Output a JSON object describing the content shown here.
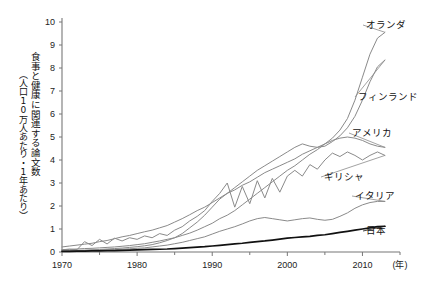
{
  "chart_data": {
    "type": "line",
    "title": "",
    "xlabel": "(年)",
    "ylabel_main": "食事と健康に関連する論文数",
    "ylabel_sub": "（人口10万人あたり・1年あたり）",
    "xlim": [
      1970,
      2015
    ],
    "ylim": [
      0,
      10
    ],
    "ytick_labels": [
      "0",
      "1",
      "2",
      "3",
      "4",
      "5",
      "6",
      "7",
      "8",
      "9",
      "10"
    ],
    "yticks": [
      0,
      1,
      2,
      3,
      4,
      5,
      6,
      7,
      8,
      9,
      10
    ],
    "xtick_labels": [
      "1970",
      "1980",
      "1990",
      "2000",
      "2010"
    ],
    "xticks": [
      1970,
      1980,
      1990,
      2000,
      2010
    ],
    "xminor_step": 5,
    "grid": false,
    "legend": "inline-right-end-labels",
    "series": [
      {
        "name": "オランダ",
        "color": "#8a8a8a",
        "width": 1.0,
        "label_x": 366,
        "label_y": 28,
        "x": [
          1970,
          1971,
          1972,
          1973,
          1974,
          1975,
          1976,
          1977,
          1978,
          1979,
          1980,
          1981,
          1982,
          1983,
          1984,
          1985,
          1986,
          1987,
          1988,
          1989,
          1990,
          1991,
          1992,
          1993,
          1994,
          1995,
          1996,
          1997,
          1998,
          1999,
          2000,
          2001,
          2002,
          2003,
          2004,
          2005,
          2006,
          2007,
          2008,
          2009,
          2010,
          2011,
          2012,
          2013
        ],
        "values": [
          0.1,
          0.12,
          0.13,
          0.15,
          0.16,
          0.18,
          0.2,
          0.22,
          0.25,
          0.28,
          0.32,
          0.36,
          0.42,
          0.48,
          0.55,
          0.62,
          0.72,
          0.82,
          0.95,
          1.1,
          1.25,
          1.45,
          1.6,
          1.8,
          2.05,
          2.3,
          2.55,
          2.8,
          3.05,
          3.3,
          3.55,
          3.75,
          4.0,
          4.25,
          4.45,
          4.7,
          4.95,
          5.3,
          5.8,
          6.6,
          7.6,
          8.6,
          9.3,
          9.55
        ]
      },
      {
        "name": "フィンランド",
        "color": "#8a8a8a",
        "width": 1.0,
        "label_x": 358,
        "label_y": 100,
        "x": [
          1970,
          1971,
          1972,
          1973,
          1974,
          1975,
          1976,
          1977,
          1978,
          1979,
          1980,
          1981,
          1982,
          1983,
          1984,
          1985,
          1986,
          1987,
          1988,
          1989,
          1990,
          1991,
          1992,
          1993,
          1994,
          1995,
          1996,
          1997,
          1998,
          1999,
          2000,
          2001,
          2002,
          2003,
          2004,
          2005,
          2006,
          2007,
          2008,
          2009,
          2010,
          2011,
          2012,
          2013
        ],
        "values": [
          0.05,
          0.06,
          0.07,
          0.08,
          0.1,
          0.11,
          0.13,
          0.15,
          0.17,
          0.2,
          0.23,
          0.27,
          0.32,
          0.4,
          0.5,
          0.62,
          0.8,
          1.05,
          1.3,
          1.6,
          1.95,
          2.3,
          2.55,
          2.8,
          3.05,
          3.3,
          3.55,
          3.75,
          3.95,
          4.15,
          4.35,
          4.55,
          4.7,
          4.6,
          4.55,
          4.6,
          4.8,
          5.05,
          5.4,
          5.9,
          6.6,
          7.4,
          8.05,
          8.35
        ]
      },
      {
        "name": "アメリカ",
        "color": "#8a8a8a",
        "width": 1.0,
        "label_x": 352,
        "label_y": 136,
        "x": [
          1970,
          1971,
          1972,
          1973,
          1974,
          1975,
          1976,
          1977,
          1978,
          1979,
          1980,
          1981,
          1982,
          1983,
          1984,
          1985,
          1986,
          1987,
          1988,
          1989,
          1990,
          1991,
          1992,
          1993,
          1994,
          1995,
          1996,
          1997,
          1998,
          1999,
          2000,
          2001,
          2002,
          2003,
          2004,
          2005,
          2006,
          2007,
          2008,
          2009,
          2010,
          2011,
          2012,
          2013
        ],
        "values": [
          0.22,
          0.26,
          0.3,
          0.34,
          0.38,
          0.45,
          0.5,
          0.58,
          0.66,
          0.72,
          0.8,
          0.88,
          0.95,
          1.05,
          1.15,
          1.3,
          1.45,
          1.62,
          1.8,
          1.95,
          2.15,
          2.35,
          2.55,
          2.7,
          2.9,
          3.05,
          3.25,
          3.45,
          3.6,
          3.75,
          3.9,
          4.05,
          4.25,
          4.4,
          4.55,
          4.7,
          4.85,
          4.95,
          5.0,
          4.95,
          4.85,
          4.7,
          4.6,
          4.55
        ]
      },
      {
        "name": "ギリシャ",
        "color": "#8a8a8a",
        "width": 1.0,
        "label_x": 324,
        "label_y": 180,
        "x": [
          1970,
          1971,
          1972,
          1973,
          1974,
          1975,
          1976,
          1977,
          1978,
          1979,
          1980,
          1981,
          1982,
          1983,
          1984,
          1985,
          1986,
          1987,
          1988,
          1989,
          1990,
          1991,
          1992,
          1993,
          1994,
          1995,
          1996,
          1997,
          1998,
          1999,
          2000,
          2001,
          2002,
          2003,
          2004,
          2005,
          2006,
          2007,
          2008,
          2009,
          2010,
          2011,
          2012,
          2013
        ],
        "values": [
          0.1,
          0.12,
          0.1,
          0.45,
          0.28,
          0.55,
          0.35,
          0.6,
          0.48,
          0.62,
          0.55,
          0.7,
          0.62,
          0.8,
          0.72,
          0.95,
          1.1,
          1.35,
          1.55,
          1.8,
          2.2,
          2.55,
          3.0,
          1.95,
          2.85,
          2.1,
          3.1,
          2.35,
          3.2,
          2.6,
          3.3,
          3.55,
          3.3,
          3.8,
          3.6,
          4.0,
          4.3,
          4.15,
          4.35,
          4.2,
          4.0,
          4.2,
          4.35,
          4.2
        ]
      },
      {
        "name": "イタリア",
        "color": "#8a8a8a",
        "width": 1.0,
        "label_x": 355,
        "label_y": 199,
        "x": [
          1970,
          1971,
          1972,
          1973,
          1974,
          1975,
          1976,
          1977,
          1978,
          1979,
          1980,
          1981,
          1982,
          1983,
          1984,
          1985,
          1986,
          1987,
          1988,
          1989,
          1990,
          1991,
          1992,
          1993,
          1994,
          1995,
          1996,
          1997,
          1998,
          1999,
          2000,
          2001,
          2002,
          2003,
          2004,
          2005,
          2006,
          2007,
          2008,
          2009,
          2010,
          2011,
          2012,
          2013
        ],
        "values": [
          0.04,
          0.05,
          0.05,
          0.06,
          0.07,
          0.08,
          0.09,
          0.1,
          0.12,
          0.14,
          0.16,
          0.18,
          0.22,
          0.26,
          0.3,
          0.36,
          0.42,
          0.5,
          0.58,
          0.66,
          0.78,
          0.9,
          1.0,
          1.1,
          1.22,
          1.35,
          1.45,
          1.5,
          1.45,
          1.4,
          1.35,
          1.4,
          1.45,
          1.48,
          1.42,
          1.38,
          1.42,
          1.55,
          1.7,
          1.9,
          2.05,
          2.15,
          2.2,
          2.2
        ]
      },
      {
        "name": "日本",
        "color": "#111111",
        "width": 1.7,
        "label_x": 366,
        "label_y": 234,
        "x": [
          1970,
          1971,
          1972,
          1973,
          1974,
          1975,
          1976,
          1977,
          1978,
          1979,
          1980,
          1981,
          1982,
          1983,
          1984,
          1985,
          1986,
          1987,
          1988,
          1989,
          1990,
          1991,
          1992,
          1993,
          1994,
          1995,
          1996,
          1997,
          1998,
          1999,
          2000,
          2001,
          2002,
          2003,
          2004,
          2005,
          2006,
          2007,
          2008,
          2009,
          2010,
          2011,
          2012,
          2013
        ],
        "values": [
          0.03,
          0.03,
          0.04,
          0.04,
          0.05,
          0.05,
          0.06,
          0.06,
          0.07,
          0.08,
          0.09,
          0.1,
          0.11,
          0.12,
          0.13,
          0.15,
          0.17,
          0.19,
          0.21,
          0.23,
          0.26,
          0.29,
          0.32,
          0.35,
          0.38,
          0.42,
          0.45,
          0.48,
          0.52,
          0.56,
          0.6,
          0.63,
          0.66,
          0.68,
          0.72,
          0.75,
          0.8,
          0.85,
          0.9,
          0.95,
          1.0,
          1.05,
          1.1,
          1.12
        ]
      }
    ]
  },
  "axes": {
    "x_unit_label": "(年)"
  }
}
